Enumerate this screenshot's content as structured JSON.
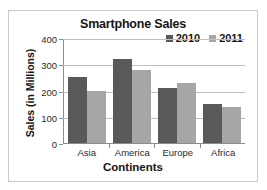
{
  "top_sliver_text": "",
  "colors": {
    "series_2010": "#595959",
    "series_2011": "#a6a6a6",
    "gridline": "#bfbfbf",
    "axis": "#8c8c8c",
    "frame_border": "#c9c9c9",
    "text": "#161616",
    "background": "#ffffff"
  },
  "chart_data": {
    "type": "bar",
    "title": "Smartphone Sales",
    "xlabel": "Continents",
    "ylabel": "Sales (in Millions)",
    "categories": [
      "Asia",
      "America",
      "Europe",
      "Africa"
    ],
    "series": [
      {
        "name": "2010",
        "color": "#595959",
        "values": [
          250,
          320,
          210,
          150
        ]
      },
      {
        "name": "2011",
        "color": "#a6a6a6",
        "values": [
          200,
          280,
          228,
          138
        ]
      }
    ],
    "ylim": [
      0,
      400
    ],
    "yticks": [
      0,
      100,
      200,
      300,
      400
    ],
    "ytick_labels": [
      "0",
      "100",
      "200",
      "300",
      "400"
    ],
    "grid": true,
    "grid_axis": "y",
    "legend": {
      "position": "top-right",
      "entries": [
        "2010",
        "2011"
      ]
    },
    "bar_orientation": "vertical",
    "grouped": true
  }
}
